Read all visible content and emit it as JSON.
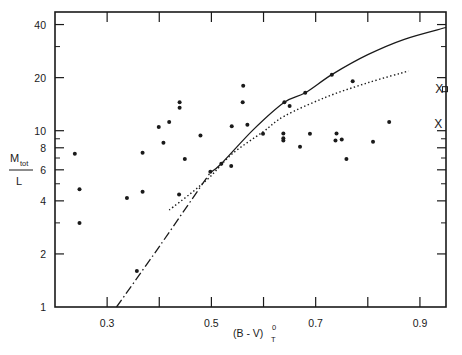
{
  "chart_data": {
    "type": "scatter",
    "title": "",
    "xlabel": "(B - V)",
    "xlabel_superscript": "0",
    "xlabel_subscript": "T",
    "ylabel_numerator": "M",
    "ylabel_numerator_subscript": "tot",
    "ylabel_denominator": "L",
    "xlim": [
      0.2,
      0.95
    ],
    "ylim": [
      1,
      46
    ],
    "yscale": "log",
    "grid": false,
    "legend": null,
    "x_ticks": [
      0.3,
      0.4,
      0.5,
      0.6,
      0.7,
      0.8,
      0.9
    ],
    "x_tick_labels": [
      "0.3",
      "",
      "0.5",
      "",
      "0.7",
      "",
      "0.9"
    ],
    "y_major_ticks": [
      1,
      2,
      4,
      6,
      8,
      10,
      20,
      40
    ],
    "y_tick_labels": [
      "1",
      "2",
      "4",
      "6",
      "8",
      "10",
      "20",
      "40"
    ],
    "y_minor_ticks": [
      3,
      5,
      7,
      9,
      30
    ],
    "series": [
      {
        "name": "galaxies",
        "marker": "dot",
        "points": [
          [
            0.238,
            7.4
          ],
          [
            0.247,
            4.65
          ],
          [
            0.247,
            3.0
          ],
          [
            0.338,
            4.15
          ],
          [
            0.357,
            1.6
          ],
          [
            0.368,
            7.5
          ],
          [
            0.368,
            4.5
          ],
          [
            0.399,
            10.5
          ],
          [
            0.408,
            8.55
          ],
          [
            0.419,
            11.2
          ],
          [
            0.438,
            4.35
          ],
          [
            0.439,
            14.5
          ],
          [
            0.439,
            13.5
          ],
          [
            0.449,
            6.9
          ],
          [
            0.479,
            9.4
          ],
          [
            0.498,
            5.85
          ],
          [
            0.519,
            6.5
          ],
          [
            0.538,
            6.3
          ],
          [
            0.539,
            10.6
          ],
          [
            0.56,
            14.5
          ],
          [
            0.561,
            18.0
          ],
          [
            0.569,
            10.8
          ],
          [
            0.599,
            9.6
          ],
          [
            0.638,
            9.65
          ],
          [
            0.638,
            9.05
          ],
          [
            0.638,
            8.8
          ],
          [
            0.64,
            14.5
          ],
          [
            0.65,
            13.8
          ],
          [
            0.67,
            8.1
          ],
          [
            0.68,
            16.4
          ],
          [
            0.689,
            9.6
          ],
          [
            0.731,
            20.8
          ],
          [
            0.738,
            8.8
          ],
          [
            0.74,
            9.65
          ],
          [
            0.75,
            8.9
          ],
          [
            0.759,
            6.9
          ],
          [
            0.771,
            19.1
          ],
          [
            0.81,
            8.65
          ],
          [
            0.841,
            11.2
          ]
        ]
      },
      {
        "name": "cross markers",
        "marker": "x",
        "points": [
          [
            0.937,
            17.2
          ],
          [
            0.935,
            10.9
          ]
        ]
      },
      {
        "name": "square marker",
        "marker": "square",
        "points": [
          [
            0.948,
            17.2
          ]
        ]
      }
    ],
    "curves": [
      {
        "name": "solid model",
        "style": "solid",
        "points": [
          [
            0.498,
            5.8
          ],
          [
            0.519,
            6.5
          ],
          [
            0.58,
            10.1
          ],
          [
            0.64,
            14.5
          ],
          [
            0.68,
            16.4
          ],
          [
            0.731,
            20.8
          ],
          [
            0.8,
            27.0
          ],
          [
            0.87,
            33.0
          ],
          [
            0.95,
            38.5
          ]
        ]
      },
      {
        "name": "dotted model",
        "style": "dotted",
        "points": [
          [
            0.419,
            3.55
          ],
          [
            0.46,
            4.4
          ],
          [
            0.498,
            5.5
          ],
          [
            0.54,
            7.4
          ],
          [
            0.6,
            9.9
          ],
          [
            0.64,
            12.1
          ],
          [
            0.72,
            15.5
          ],
          [
            0.8,
            18.7
          ],
          [
            0.878,
            21.8
          ]
        ]
      },
      {
        "name": "dash-dot extrapolation",
        "style": "dashdot",
        "points": [
          [
            0.318,
            1.0
          ],
          [
            0.4,
            2.2
          ],
          [
            0.498,
            5.8
          ]
        ]
      }
    ]
  },
  "plot_box": {
    "left": 55,
    "right": 446,
    "top": 12,
    "bottom": 307
  },
  "colors": {
    "ink": "#1a1a1a",
    "background": "#ffffff"
  }
}
